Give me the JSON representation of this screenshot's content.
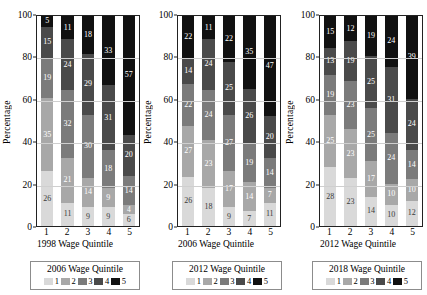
{
  "chart_data": {
    "type": "bar",
    "subtype": "stacked-percentage",
    "title": "",
    "ylabel": "Percentage",
    "ylim": [
      0,
      100
    ],
    "yticks": [
      0,
      20,
      40,
      60,
      80,
      100
    ],
    "grid": true,
    "legend_position": "bottom",
    "categories": [
      "1",
      "2",
      "3",
      "4",
      "5"
    ],
    "series_names": [
      "1",
      "2",
      "3",
      "4",
      "5"
    ],
    "colors": [
      "#d9d9d9",
      "#a8a8a8",
      "#7b7b7b",
      "#4a4a4a",
      "#111111"
    ],
    "panels": [
      {
        "xlabel": "1998 Wage Quintile",
        "legend_title": "2006 Wage Quintile",
        "bars": [
          {
            "category": "1",
            "values": [
              26,
              35,
              19,
              15,
              5
            ]
          },
          {
            "category": "2",
            "values": [
              11,
              21,
              32,
              24,
              11
            ]
          },
          {
            "category": "3",
            "values": [
              9,
              14,
              30,
              29,
              18
            ]
          },
          {
            "category": "4",
            "values": [
              9,
              9,
              18,
              31,
              33
            ]
          },
          {
            "category": "5",
            "values": [
              6,
              4,
              14,
              20,
              57
            ]
          }
        ]
      },
      {
        "xlabel": "2006 Wage Quintile",
        "legend_title": "2012 Wage Quintile",
        "bars": [
          {
            "category": "1",
            "values": [
              26,
              27,
              22,
              14,
              22
            ]
          },
          {
            "category": "2",
            "values": [
              18,
              23,
              24,
              24,
              11
            ]
          },
          {
            "category": "3",
            "values": [
              9,
              17,
              27,
              25,
              22
            ]
          },
          {
            "category": "4",
            "values": [
              7,
              14,
              19,
              26,
              35
            ]
          },
          {
            "category": "5",
            "values": [
              11,
              7,
              14,
              20,
              47
            ]
          }
        ]
      },
      {
        "xlabel": "2012 Wage Quintile",
        "legend_title": "2018 Wage Quintile",
        "bars": [
          {
            "category": "1",
            "values": [
              28,
              25,
              19,
              13,
              15
            ]
          },
          {
            "category": "2",
            "values": [
              23,
              23,
              23,
              19,
              12
            ]
          },
          {
            "category": "3",
            "values": [
              14,
              17,
              25,
              25,
              19
            ]
          },
          {
            "category": "4",
            "values": [
              10,
              10,
              24,
              31,
              24
            ]
          },
          {
            "category": "5",
            "values": [
              12,
              10,
              14,
              24,
              39
            ]
          }
        ]
      }
    ]
  }
}
